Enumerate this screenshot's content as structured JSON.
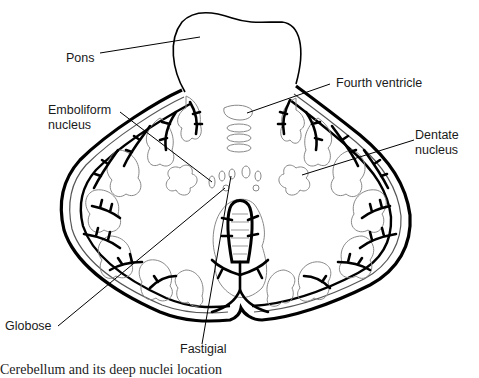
{
  "figure": {
    "caption": "Cerebellum and its deep nuclei location",
    "labels": {
      "pons": "Pons",
      "fourth_ventricle": "Fourth ventricle",
      "emboliform_line1": "Emboliform",
      "emboliform_line2": "nucleus",
      "dentate_line1": "Dentate",
      "dentate_line2": "nucleus",
      "globose": "Globose",
      "fastigial": "Fastigial"
    },
    "colors": {
      "outline": "#000000",
      "folia": "#777777",
      "background": "#ffffff"
    }
  }
}
